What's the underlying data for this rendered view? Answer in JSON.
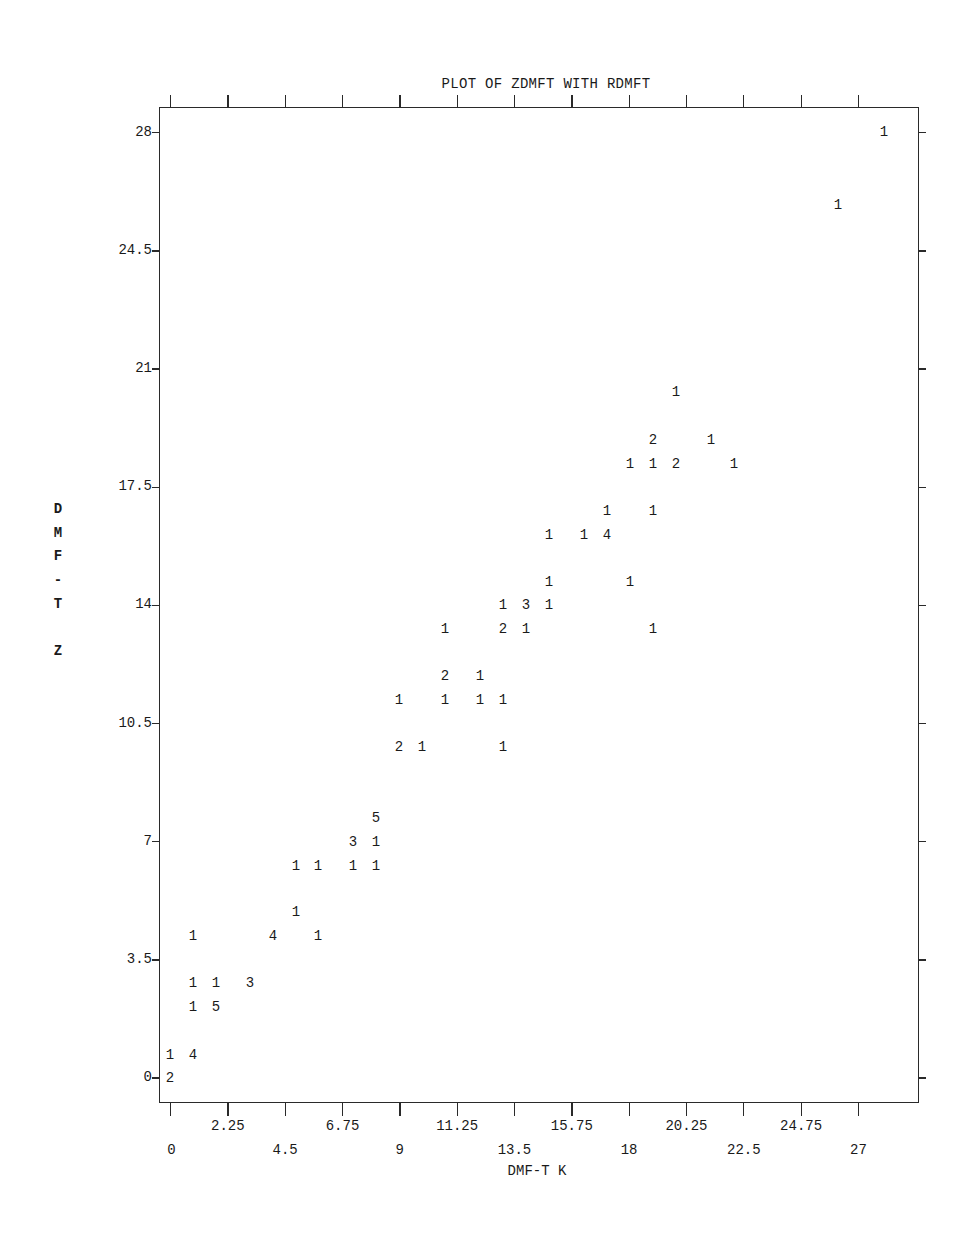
{
  "chart_data": {
    "type": "scatter",
    "title": "PLOT OF ZDMFT WITH RDMFT",
    "xlabel": "DMF-T K",
    "ylabel": "DMF-T Z",
    "xlim": [
      0,
      28.5
    ],
    "ylim": [
      -0.7,
      28.7
    ],
    "grid": false,
    "legend": "none (digits indicate number of coincident observations)",
    "x_ticks": [
      0,
      2.25,
      4.5,
      6.75,
      9,
      11.25,
      13.5,
      15.75,
      18,
      20.25,
      22.5,
      24.75,
      27
    ],
    "x_tick_labels_upper_row": [
      "2.25",
      "6.75",
      "11.25",
      "15.75",
      "20.25",
      "24.75"
    ],
    "x_tick_labels_lower_row": [
      "0",
      "4.5",
      "9",
      "13.5",
      "18",
      "22.5",
      "27"
    ],
    "y_ticks": [
      0,
      3.5,
      7,
      10.5,
      14,
      17.5,
      21,
      24.5,
      28
    ],
    "y_tick_labels": [
      "0",
      "3.5",
      "7",
      "10.5",
      "14",
      "17.5",
      "21",
      "24.5",
      "28"
    ],
    "points": [
      {
        "x": 28,
        "y": 28,
        "count": 1
      },
      {
        "x": 26,
        "y": 26,
        "count": 1
      },
      {
        "x": 20,
        "y": 20,
        "count": 1
      },
      {
        "x": 19,
        "y": 19,
        "count": 2
      },
      {
        "x": 21,
        "y": 19,
        "count": 1
      },
      {
        "x": 18,
        "y": 18,
        "count": 1
      },
      {
        "x": 19,
        "y": 18,
        "count": 1
      },
      {
        "x": 20,
        "y": 18,
        "count": 2
      },
      {
        "x": 22,
        "y": 18,
        "count": 1
      },
      {
        "x": 17,
        "y": 17,
        "count": 1
      },
      {
        "x": 19,
        "y": 17,
        "count": 1
      },
      {
        "x": 15,
        "y": 16,
        "count": 1
      },
      {
        "x": 16,
        "y": 16,
        "count": 1
      },
      {
        "x": 17,
        "y": 16,
        "count": 4
      },
      {
        "x": 15,
        "y": 15,
        "count": 1
      },
      {
        "x": 18,
        "y": 15,
        "count": 1
      },
      {
        "x": 13,
        "y": 14,
        "count": 1
      },
      {
        "x": 14,
        "y": 14,
        "count": 3
      },
      {
        "x": 15,
        "y": 14,
        "count": 1
      },
      {
        "x": 11,
        "y": 13,
        "count": 1
      },
      {
        "x": 13,
        "y": 13,
        "count": 2
      },
      {
        "x": 14,
        "y": 13,
        "count": 1
      },
      {
        "x": 19,
        "y": 13,
        "count": 1
      },
      {
        "x": 11,
        "y": 12,
        "count": 2
      },
      {
        "x": 12,
        "y": 12,
        "count": 1
      },
      {
        "x": 9,
        "y": 11,
        "count": 1
      },
      {
        "x": 11,
        "y": 11,
        "count": 1
      },
      {
        "x": 12,
        "y": 11,
        "count": 1
      },
      {
        "x": 13,
        "y": 11,
        "count": 1
      },
      {
        "x": 9,
        "y": 10,
        "count": 2
      },
      {
        "x": 10,
        "y": 10,
        "count": 1
      },
      {
        "x": 13,
        "y": 10,
        "count": 1
      },
      {
        "x": 8,
        "y": 8,
        "count": 5
      },
      {
        "x": 7,
        "y": 7,
        "count": 3
      },
      {
        "x": 8,
        "y": 7,
        "count": 1
      },
      {
        "x": 5,
        "y": 6,
        "count": 1
      },
      {
        "x": 6,
        "y": 6,
        "count": 1
      },
      {
        "x": 7,
        "y": 6,
        "count": 1
      },
      {
        "x": 8,
        "y": 6,
        "count": 1
      },
      {
        "x": 5,
        "y": 5,
        "count": 1
      },
      {
        "x": 1,
        "y": 4,
        "count": 1
      },
      {
        "x": 4,
        "y": 4,
        "count": 4
      },
      {
        "x": 6,
        "y": 4,
        "count": 1
      },
      {
        "x": 1,
        "y": 3,
        "count": 1
      },
      {
        "x": 2,
        "y": 3,
        "count": 1
      },
      {
        "x": 3,
        "y": 3,
        "count": 3
      },
      {
        "x": 1,
        "y": 2,
        "count": 1
      },
      {
        "x": 2,
        "y": 2,
        "count": 5
      },
      {
        "x": 0,
        "y": 1,
        "count": 1
      },
      {
        "x": 1,
        "y": 1,
        "count": 4
      },
      {
        "x": 0,
        "y": 0,
        "count": 2
      }
    ]
  },
  "ylabel_letters": [
    "D",
    "M",
    "F",
    "-",
    "T",
    "",
    "Z"
  ]
}
